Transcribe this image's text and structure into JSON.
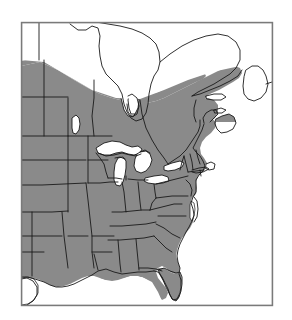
{
  "figure": {
    "type": "distribution-range-map",
    "region": "Eastern North America",
    "title": "",
    "caption": "",
    "width": 292,
    "height": 320
  },
  "colors": {
    "background": "#ffffff",
    "range_shading": "#8a8a8a",
    "boundary_line": "#1a1a1a",
    "frame": "#7a7a7a",
    "water": "#ffffff"
  },
  "frame": {
    "x": 21,
    "y": 22,
    "width": 251,
    "height": 283,
    "stroke_width": 1
  },
  "legend": {
    "present": false,
    "items": [
      {
        "label": "",
        "swatch": "#8a8a8a"
      }
    ]
  },
  "labels": {
    "text_items": []
  },
  "features": {
    "shaded_range": "eastern United States, southern Canada, Gulf of St. Lawrence coast",
    "water_bodies": [
      "Hudson Bay",
      "James Bay",
      "Lake Superior",
      "Lake Michigan",
      "Lake Huron",
      "Lake Erie",
      "Lake Ontario",
      "Lake Winnipeg",
      "Gulf of Mexico",
      "Atlantic Ocean",
      "Gulf of St. Lawrence",
      "Chesapeake Bay"
    ],
    "boundaries": "state and provincial political boundaries"
  }
}
